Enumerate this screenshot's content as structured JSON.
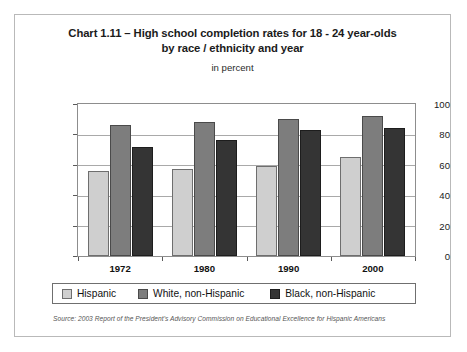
{
  "chart_data": {
    "type": "bar",
    "title": "Chart 1.11 – High school completion rates for 18 - 24 year-olds by race / ethnicity and year",
    "title_line1": "Chart 1.11 – High school completion rates for 18 - 24 year-olds",
    "title_line2": "by race / ethnicity and year",
    "subtitle": "in percent",
    "xlabel": "",
    "ylabel": "",
    "ylim": [
      0,
      100
    ],
    "yticks": [
      0,
      20,
      40,
      60,
      80,
      100
    ],
    "ytick_labels": [
      "0",
      "20",
      "40",
      "60",
      "80",
      "100"
    ],
    "grid": true,
    "legend_position": "bottom",
    "categories": [
      "1972",
      "1980",
      "1990",
      "2000"
    ],
    "series": [
      {
        "name": "Hispanic",
        "color": "#cfcfcf",
        "values": [
          56,
          57,
          59,
          65
        ]
      },
      {
        "name": "White, non-Hispanic",
        "color": "#7d7d7d",
        "values": [
          86,
          88,
          90,
          92
        ]
      },
      {
        "name": "Black, non-Hispanic",
        "color": "#343434",
        "values": [
          72,
          76,
          83,
          84
        ]
      }
    ],
    "source": "Source: 2003 Report of the President's Advisory Commission on Educational Excellence for Hispanic Americans"
  }
}
